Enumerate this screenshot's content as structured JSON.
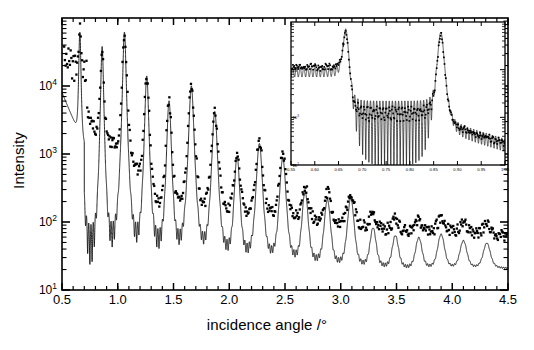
{
  "chart_data": {
    "type": "line",
    "title": "",
    "xlabel": "incidence angle /°",
    "ylabel": "Intensity",
    "xlim": [
      0.5,
      4.5
    ],
    "ylim": [
      10,
      100000
    ],
    "yscale": "log",
    "xscale": "linear",
    "grid": false,
    "legend": "none",
    "xticks": [
      0.5,
      1.0,
      1.5,
      2.0,
      2.5,
      3.0,
      3.5,
      4.0,
      4.5
    ],
    "xticklabels": [
      "0.5",
      "1.0",
      "1.5",
      "2.0",
      "2.5",
      "3.0",
      "3.5",
      "4.0",
      "4.5"
    ],
    "yticks": [
      10,
      100,
      1000,
      10000
    ],
    "yticklabels": [
      "10",
      "10",
      "10",
      "10"
    ],
    "yticksup": [
      "1",
      "2",
      "3",
      "4"
    ],
    "series": [
      {
        "name": "measured reflectivity",
        "style": "dots",
        "marker": "square",
        "comment": "experimental X-ray reflectivity data, scattered points"
      },
      {
        "name": "simulated reflectivity",
        "style": "line",
        "comment": "fit / simulation curve with Kiessig fringes, offset below data at high angle"
      }
    ],
    "bragg_peaks_deg": [
      0.66,
      0.86,
      1.06,
      1.26,
      1.46,
      1.66,
      1.87,
      2.07,
      2.27,
      2.48,
      2.68,
      2.88,
      3.09,
      3.29,
      3.49,
      3.7,
      3.9,
      4.1,
      4.31
    ],
    "bragg_peak_intensity": [
      60000,
      38000,
      62000,
      14000,
      6000,
      10000,
      4200,
      900,
      1400,
      850,
      260,
      190,
      200,
      60,
      42,
      38,
      45,
      32,
      28
    ],
    "measured_baseline": [
      {
        "angle": 0.55,
        "intensity": 22000
      },
      {
        "angle": 0.8,
        "intensity": 2100
      },
      {
        "angle": 1.1,
        "intensity": 900
      },
      {
        "angle": 1.35,
        "intensity": 150
      },
      {
        "angle": 1.6,
        "intensity": 135
      },
      {
        "angle": 1.9,
        "intensity": 130
      },
      {
        "angle": 2.3,
        "intensity": 115
      },
      {
        "angle": 2.7,
        "intensity": 100
      },
      {
        "angle": 3.1,
        "intensity": 82
      },
      {
        "angle": 3.6,
        "intensity": 70
      },
      {
        "angle": 4.1,
        "intensity": 66
      },
      {
        "angle": 4.45,
        "intensity": 62
      }
    ],
    "simulation_baseline": [
      {
        "angle": 1.35,
        "intensity": 45
      },
      {
        "angle": 1.7,
        "intensity": 40
      },
      {
        "angle": 2.1,
        "intensity": 34
      },
      {
        "angle": 2.6,
        "intensity": 28
      },
      {
        "angle": 3.1,
        "intensity": 23
      },
      {
        "angle": 3.6,
        "intensity": 21
      },
      {
        "angle": 4.1,
        "intensity": 21
      },
      {
        "angle": 4.45,
        "intensity": 21
      }
    ],
    "inset": {
      "type": "line",
      "xlim": [
        0.55,
        1.0
      ],
      "ylim": [
        100,
        100000
      ],
      "yscale": "log",
      "xticks": [
        0.55,
        0.6,
        0.65,
        0.7,
        0.75,
        0.8,
        0.85,
        0.9,
        0.95,
        1.0
      ],
      "xticklabels": [
        "0.55",
        "0.60",
        "0.65",
        "0.70",
        "0.75",
        "0.80",
        "0.85",
        "0.90",
        "0.95",
        "1.00"
      ],
      "yticks": [
        100,
        1000,
        10000
      ],
      "yticklabels": [
        "10",
        "10",
        "10"
      ],
      "yticksup": [
        "2",
        "3",
        "4"
      ],
      "bragg_peaks_deg": [
        0.665,
        0.865
      ],
      "description": "magnified view of first two Bragg peaks showing high-frequency Kiessig fringes between them",
      "series": [
        {
          "name": "measured reflectivity",
          "style": "dots"
        },
        {
          "name": "simulated reflectivity",
          "style": "line"
        }
      ]
    }
  },
  "axes": {
    "y_label": "Intensity",
    "x_label": "incidence angle /°"
  },
  "colors": {
    "foreground": "#000000",
    "background": "#ffffff",
    "data": "#000000"
  }
}
